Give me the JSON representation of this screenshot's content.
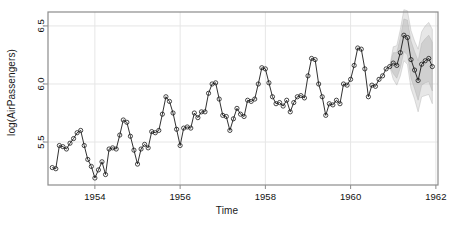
{
  "chart_data": {
    "type": "line",
    "title": "",
    "xlabel": "Time",
    "ylabel": "log(AirPassengers)",
    "xlim": [
      1952.9,
      1962.05
    ],
    "ylim": [
      5.13,
      6.62
    ],
    "xticks": [
      1954,
      1956,
      1958,
      1960,
      1962
    ],
    "xticklabels": [
      "1954",
      "1956",
      "1958",
      "1960",
      "1962"
    ],
    "yticks": [
      5.5,
      6.0,
      6.5
    ],
    "yticklabels": [
      "5.5",
      "6.0",
      "6.5"
    ],
    "grid": true,
    "grid_color": "#e6e6e6",
    "box_color": "#8c8c8c",
    "line_color": "#1a1a1a",
    "point_marker": "open-circle",
    "point_color": "#1a1a1a",
    "forecast_band_color": "#b0b0b0",
    "series": [
      {
        "name": "log(AirPassengers) observed",
        "x": [
          1953.0,
          1953.0833,
          1953.1667,
          1953.25,
          1953.3333,
          1953.4167,
          1953.5,
          1953.5833,
          1953.6667,
          1953.75,
          1953.8333,
          1953.9167,
          1954.0,
          1954.0833,
          1954.1667,
          1954.25,
          1954.3333,
          1954.4167,
          1954.5,
          1954.5833,
          1954.6667,
          1954.75,
          1954.8333,
          1954.9167,
          1955.0,
          1955.0833,
          1955.1667,
          1955.25,
          1955.3333,
          1955.4167,
          1955.5,
          1955.5833,
          1955.6667,
          1955.75,
          1955.8333,
          1955.9167,
          1956.0,
          1956.0833,
          1956.1667,
          1956.25,
          1956.3333,
          1956.4167,
          1956.5,
          1956.5833,
          1956.6667,
          1956.75,
          1956.8333,
          1956.9167,
          1957.0,
          1957.0833,
          1957.1667,
          1957.25,
          1957.3333,
          1957.4167,
          1957.5,
          1957.5833,
          1957.6667,
          1957.75,
          1957.8333,
          1957.9167,
          1958.0,
          1958.0833,
          1958.1667,
          1958.25,
          1958.3333,
          1958.4167,
          1958.5,
          1958.5833,
          1958.6667,
          1958.75,
          1958.8333,
          1958.9167,
          1959.0,
          1959.0833,
          1959.1667,
          1959.25,
          1959.3333,
          1959.4167,
          1959.5,
          1959.5833,
          1959.6667,
          1959.75,
          1959.8333,
          1959.9167,
          1960.0,
          1960.0833,
          1960.1667,
          1960.25,
          1960.3333,
          1960.4167,
          1960.5,
          1960.5833,
          1960.6667,
          1960.75,
          1960.8333,
          1960.9167
        ],
        "values": [
          5.28,
          5.27,
          5.47,
          5.46,
          5.44,
          5.49,
          5.53,
          5.58,
          5.6,
          5.47,
          5.35,
          5.29,
          5.19,
          5.26,
          5.33,
          5.22,
          5.44,
          5.45,
          5.44,
          5.56,
          5.69,
          5.67,
          5.55,
          5.43,
          5.31,
          5.44,
          5.48,
          5.45,
          5.59,
          5.58,
          5.6,
          5.74,
          5.89,
          5.85,
          5.75,
          5.61,
          5.47,
          5.62,
          5.63,
          5.62,
          5.75,
          5.71,
          5.76,
          5.76,
          5.92,
          6.0,
          6.01,
          5.87,
          5.73,
          5.72,
          5.6,
          5.7,
          5.79,
          5.74,
          5.72,
          5.86,
          5.85,
          5.87,
          6.0,
          6.14,
          6.13,
          6.01,
          5.89,
          5.83,
          5.84,
          5.81,
          5.86,
          5.76,
          5.84,
          5.89,
          5.9,
          5.88,
          6.07,
          6.22,
          6.21,
          6.0,
          5.89,
          5.73,
          5.83,
          5.82,
          5.86,
          5.83,
          6.0,
          5.99,
          6.04,
          6.16,
          6.31,
          6.3,
          6.13,
          5.89,
          5.99,
          5.98,
          6.04,
          6.07,
          6.13,
          6.15
        ],
        "n_points": 96
      },
      {
        "name": "forecast mean",
        "x": [
          1961.0,
          1961.0833,
          1961.1667,
          1961.25,
          1961.3333,
          1961.4167,
          1961.5,
          1961.5833,
          1961.6667,
          1961.75,
          1961.8333,
          1961.9167
        ],
        "values": [
          6.18,
          6.16,
          6.27,
          6.42,
          6.4,
          6.21,
          6.12,
          6.03,
          6.17,
          6.2,
          6.22,
          6.15
        ],
        "n_points": 12
      }
    ],
    "forecast_bands": [
      {
        "level": "80%",
        "lower": [
          6.09,
          6.05,
          6.14,
          6.28,
          6.25,
          6.05,
          5.96,
          5.86,
          5.99,
          6.01,
          6.02,
          5.94
        ],
        "upper": [
          6.27,
          6.27,
          6.4,
          6.56,
          6.55,
          6.37,
          6.28,
          6.2,
          6.35,
          6.39,
          6.42,
          6.36
        ]
      },
      {
        "level": "95%",
        "lower": [
          6.04,
          5.99,
          6.07,
          6.2,
          6.17,
          5.96,
          5.87,
          5.76,
          5.89,
          5.9,
          5.91,
          5.83
        ],
        "upper": [
          6.32,
          6.33,
          6.47,
          6.64,
          6.63,
          6.46,
          6.37,
          6.3,
          6.45,
          6.5,
          6.53,
          6.47
        ]
      }
    ],
    "annotations": [],
    "legend": null,
    "legend_position": "none"
  },
  "axes": {
    "y_axis_label": "log(AirPassengers)",
    "x_axis_label": "Time"
  }
}
